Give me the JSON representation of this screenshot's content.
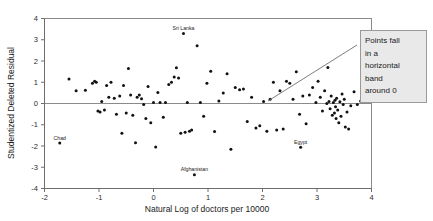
{
  "figure": {
    "title": "",
    "background": "#ffffff"
  },
  "axes": {
    "x_title": "Natural Log of doctors per 10000",
    "y_title": "Studentized Deleted Residual",
    "x_ticks": [
      "-2",
      "-1",
      "0",
      "1",
      "2",
      "3",
      "4"
    ],
    "y_ticks": [
      "4",
      "3",
      "2",
      "1",
      "0",
      "-1",
      "-2",
      "-3",
      "-4"
    ]
  },
  "callout": {
    "lines": [
      "Points fall",
      "in a",
      "horizontal",
      "band",
      "around 0"
    ],
    "fill": "#e9e9e9",
    "border": "#9a9a9a"
  },
  "point_labels": [
    {
      "text": "Sri Lanka",
      "x": 0.55,
      "y": 3.3
    },
    {
      "text": "Chad",
      "x": -1.72,
      "y": -1.86
    },
    {
      "text": "Afghanistan",
      "x": 0.75,
      "y": -3.35
    },
    {
      "text": "Egypt",
      "x": 2.7,
      "y": -2.06
    }
  ],
  "chart_data": {
    "type": "scatter",
    "title": "",
    "xlabel": "Natural Log of doctors per 10000",
    "ylabel": "Studentized Deleted Residual",
    "xlim": [
      -2,
      4
    ],
    "ylim": [
      -4,
      4
    ],
    "grid": false,
    "legend": "none",
    "marker_color": "#111111",
    "marker_size": 2,
    "reference_line_y": 0,
    "annotations": [
      {
        "text": "Points fall in a horizontal band around 0",
        "points_to": [
          2.85,
          0.3
        ]
      },
      {
        "text": "Sri Lanka",
        "point": [
          0.55,
          3.3
        ]
      },
      {
        "text": "Chad",
        "point": [
          -1.72,
          -1.86
        ]
      },
      {
        "text": "Afghanistan",
        "point": [
          0.75,
          -3.35
        ]
      },
      {
        "text": "Egypt",
        "point": [
          2.7,
          -2.06
        ]
      }
    ],
    "x": [
      -1.72,
      -1.55,
      -1.42,
      -1.25,
      -1.12,
      -1.08,
      -1.05,
      -1.02,
      -0.98,
      -0.95,
      -0.9,
      -0.86,
      -0.82,
      -0.78,
      -0.72,
      -0.68,
      -0.62,
      -0.58,
      -0.55,
      -0.5,
      -0.46,
      -0.42,
      -0.38,
      -0.33,
      -0.3,
      -0.26,
      -0.22,
      -0.18,
      -0.14,
      -0.1,
      -0.05,
      0.0,
      0.04,
      0.08,
      0.12,
      0.18,
      0.22,
      0.28,
      0.33,
      0.38,
      0.42,
      0.46,
      0.5,
      0.55,
      0.58,
      0.62,
      0.66,
      0.7,
      0.75,
      0.8,
      0.86,
      0.92,
      0.98,
      1.05,
      1.12,
      1.2,
      1.28,
      1.35,
      1.42,
      1.5,
      1.58,
      1.65,
      1.72,
      1.8,
      1.88,
      1.95,
      2.02,
      2.08,
      2.14,
      2.2,
      2.26,
      2.32,
      2.38,
      2.44,
      2.5,
      2.56,
      2.62,
      2.68,
      2.7,
      2.74,
      2.8,
      2.86,
      2.92,
      2.98,
      3.02,
      3.06,
      3.1,
      3.14,
      3.18,
      3.2,
      3.22,
      3.24,
      3.26,
      3.28,
      3.3,
      3.32,
      3.33,
      3.34,
      3.35,
      3.36,
      3.38,
      3.4,
      3.42,
      3.44,
      3.46,
      3.48,
      3.5,
      3.52,
      3.55,
      3.58,
      3.62,
      3.68,
      3.74,
      3.8
    ],
    "y": [
      -1.86,
      1.15,
      0.6,
      0.62,
      0.95,
      1.05,
      1.0,
      -0.35,
      -0.4,
      0.1,
      -0.3,
      0.85,
      0.3,
      1.0,
      0.25,
      -0.5,
      0.35,
      -1.4,
      0.85,
      -0.45,
      1.65,
      0.4,
      -0.55,
      -1.85,
      0.3,
      0.4,
      0.22,
      -0.05,
      -0.7,
      0.8,
      -0.9,
      0.05,
      -2.05,
      0.52,
      0.05,
      -0.65,
      0.05,
      0.9,
      1.0,
      1.25,
      1.68,
      1.2,
      -1.4,
      3.3,
      -1.35,
      0.05,
      -1.3,
      -1.25,
      -3.35,
      2.72,
      0.05,
      -0.6,
      0.95,
      1.52,
      -1.32,
      0.12,
      0.5,
      1.4,
      -2.15,
      0.75,
      0.65,
      0.68,
      -0.85,
      0.3,
      -1.15,
      -1.05,
      0.1,
      -1.3,
      0.2,
      1.0,
      -1.25,
      0.6,
      -1.2,
      1.05,
      0.95,
      0.2,
      1.5,
      -0.5,
      -2.06,
      0.35,
      -0.95,
      0.4,
      0.75,
      0.05,
      1.05,
      0.3,
      -0.35,
      0.6,
      0.0,
      1.7,
      0.1,
      -0.25,
      0.35,
      -0.55,
      0.05,
      -0.45,
      0.15,
      -0.15,
      -0.7,
      0.25,
      -0.3,
      -0.9,
      0.08,
      -0.6,
      0.45,
      -0.05,
      0.2,
      -1.1,
      -0.4,
      -1.2,
      -0.1,
      0.55,
      -0.05,
      0.12
    ]
  }
}
